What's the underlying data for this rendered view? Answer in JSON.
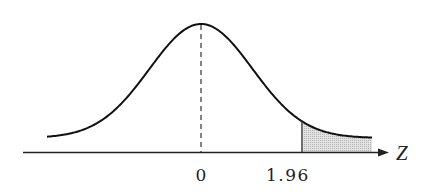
{
  "chart_data": {
    "type": "area",
    "title": "",
    "xlabel": "Z",
    "ylabel": "",
    "tick_labels": [
      "0",
      "1.96"
    ],
    "ticks": [
      0,
      1.96
    ],
    "mean_line": {
      "x": 0,
      "style": "dashed"
    },
    "shaded_region": {
      "from": 1.96,
      "to": "right tail",
      "color": "#cccccc"
    },
    "xlim": [
      -3.1,
      3.1
    ],
    "grid": false,
    "legend": null
  },
  "labels": {
    "axis": "Z",
    "zero": "0",
    "critical": "1.96"
  },
  "colors": {
    "curve": "#111111",
    "shade": "#d0d0d0",
    "axis": "#222222"
  }
}
